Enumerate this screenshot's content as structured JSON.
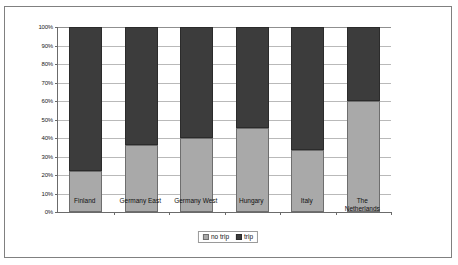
{
  "chart_data": {
    "type": "bar",
    "title": "",
    "subtitle": "",
    "xlabel": "",
    "ylabel": "",
    "stacked": true,
    "normalized": true,
    "grid": true,
    "legend_position": "bottom",
    "ylim": [
      0,
      100
    ],
    "ytick_labels": [
      "0%",
      "10%",
      "20%",
      "30%",
      "40%",
      "50%",
      "60%",
      "70%",
      "80%",
      "90%",
      "100%"
    ],
    "ytick_values": [
      0,
      10,
      20,
      30,
      40,
      50,
      60,
      70,
      80,
      90,
      100
    ],
    "categories": [
      "Finland",
      "Germany East",
      "Germany West",
      "Hungary",
      "Italy",
      "The\nNetherlands"
    ],
    "series": [
      {
        "name": "no trip",
        "color": "#a9a9a9",
        "values": [
          22,
          36,
          40,
          45.5,
          33.5,
          60
        ]
      },
      {
        "name": "trip",
        "color": "#3c3c3c",
        "values": [
          78,
          64,
          60,
          54.5,
          66.5,
          40
        ]
      }
    ],
    "legend": [
      {
        "label": "no trip",
        "swatch": "notrip"
      },
      {
        "label": "trip",
        "swatch": "trip"
      }
    ]
  },
  "frame": {
    "border_color": "#808080",
    "background": "#ffffff"
  }
}
